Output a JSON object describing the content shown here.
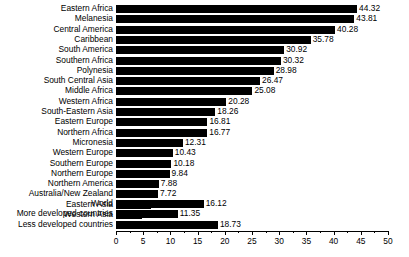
{
  "chart_data": {
    "type": "bar",
    "orientation": "horizontal",
    "title": "",
    "xlabel": "",
    "ylabel": "",
    "xlim": [
      0,
      50
    ],
    "xticks": [
      0,
      5,
      10,
      15,
      20,
      25,
      30,
      35,
      40,
      45,
      50
    ],
    "minor_tick_step": 2.5,
    "grid": false,
    "legend": false,
    "bar_color": "#000000",
    "background": "#ffffff",
    "categories": [
      "Eastern Africa",
      "Melanesia",
      "Central America",
      "Caribbean",
      "South America",
      "Southern Africa",
      "Polynesia",
      "South Central Asia",
      "Middle Africa",
      "Western Africa",
      "South-Eastern Asia",
      "Eastern Europe",
      "Northern Africa",
      "Micronesia",
      "Western Europe",
      "Southern Europe",
      "Northern Europe",
      "Northern America",
      "Australia/New Zealand",
      "Eastern Asia",
      "Western Asia"
    ],
    "values": [
      44.32,
      43.81,
      40.28,
      35.78,
      30.92,
      30.32,
      28.98,
      26.47,
      25.08,
      20.28,
      18.26,
      16.81,
      16.77,
      12.31,
      10.43,
      10.18,
      9.84,
      7.88,
      7.72,
      6.44,
      4.77
    ],
    "value_labels": [
      "44.32",
      "43.81",
      "40.28",
      "35.78",
      "30.92",
      "30.32",
      "28.98",
      "26.47",
      "25.08",
      "20.28",
      "18.26",
      "16.81",
      "16.77",
      "12.31",
      "10.43",
      "10.18",
      "9.84",
      "7.88",
      "7.72",
      "6.44",
      "4.77"
    ],
    "aggregate_categories": [
      "World",
      "More developed countries",
      "Less developed countries"
    ],
    "aggregate_values": [
      16.12,
      11.35,
      18.73
    ],
    "aggregate_value_labels": [
      "16.12",
      "11.35",
      "18.73"
    ],
    "tick_labels": [
      "0",
      "5",
      "10",
      "15",
      "20",
      "25",
      "30",
      "35",
      "40",
      "45",
      "50"
    ]
  }
}
